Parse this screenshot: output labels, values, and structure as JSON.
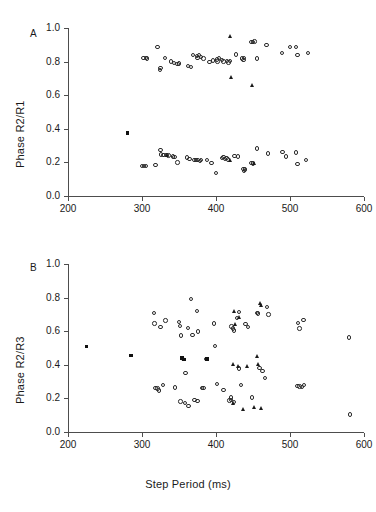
{
  "figure": {
    "xlabel": "Step Period (ms)",
    "background": "#ffffff",
    "marker_color": "#1a1a1a"
  },
  "chart_data": [
    {
      "type": "scatter",
      "panel": "A",
      "panel_letter": "A",
      "title": "",
      "xlabel": "",
      "ylabel": "Phase R2/R1",
      "xlim": [
        200,
        600
      ],
      "ylim": [
        0.0,
        1.0
      ],
      "xticks": [
        200,
        300,
        400,
        500,
        600
      ],
      "xticklabels": [
        "200",
        "300",
        "400",
        "500",
        "600"
      ],
      "yticks": [
        0.0,
        0.2,
        0.4,
        0.6,
        0.8,
        1.0
      ],
      "yticklabels": [
        "0.0",
        "0.2",
        "0.4",
        "0.6",
        "0.8",
        "1.0"
      ],
      "grid": false,
      "legend": "none",
      "series": [
        {
          "name": "open-circle",
          "marker": "circle",
          "points": [
            [
              302,
              0.823
            ],
            [
              305,
              0.82
            ],
            [
              307,
              0.818
            ],
            [
              321,
              0.888
            ],
            [
              324,
              0.75
            ],
            [
              325,
              0.762
            ],
            [
              331,
              0.82
            ],
            [
              339,
              0.8
            ],
            [
              343,
              0.79
            ],
            [
              348,
              0.785
            ],
            [
              350,
              0.788
            ],
            [
              362,
              0.775
            ],
            [
              366,
              0.767
            ],
            [
              369,
              0.838
            ],
            [
              374,
              0.832
            ],
            [
              375,
              0.82
            ],
            [
              377,
              0.838
            ],
            [
              380,
              0.826
            ],
            [
              383,
              0.818
            ],
            [
              391,
              0.797
            ],
            [
              396,
              0.806
            ],
            [
              401,
              0.812
            ],
            [
              402,
              0.8
            ],
            [
              404,
              0.82
            ],
            [
              408,
              0.808
            ],
            [
              410,
              0.8
            ],
            [
              415,
              0.805
            ],
            [
              417,
              0.795
            ],
            [
              419,
              0.802
            ],
            [
              427,
              0.842
            ],
            [
              435,
              0.818
            ],
            [
              437,
              0.808
            ],
            [
              438,
              0.82
            ],
            [
              448,
              0.918
            ],
            [
              450,
              0.915
            ],
            [
              452,
              0.92
            ],
            [
              455,
              0.818
            ],
            [
              468,
              0.9
            ],
            [
              489,
              0.852
            ],
            [
              500,
              0.888
            ],
            [
              508,
              0.886
            ],
            [
              510,
              0.838
            ],
            [
              524,
              0.852
            ],
            [
              300,
              0.18
            ],
            [
              303,
              0.178
            ],
            [
              305,
              0.18
            ],
            [
              318,
              0.185
            ],
            [
              325,
              0.272
            ],
            [
              326,
              0.248
            ],
            [
              329,
              0.243
            ],
            [
              333,
              0.243
            ],
            [
              336,
              0.24
            ],
            [
              342,
              0.235
            ],
            [
              344,
              0.232
            ],
            [
              348,
              0.2
            ],
            [
              361,
              0.228
            ],
            [
              364,
              0.222
            ],
            [
              371,
              0.213
            ],
            [
              373,
              0.214
            ],
            [
              375,
              0.215
            ],
            [
              378,
              0.21
            ],
            [
              380,
              0.214
            ],
            [
              388,
              0.214
            ],
            [
              394,
              0.198
            ],
            [
              400,
              0.138
            ],
            [
              408,
              0.226
            ],
            [
              410,
              0.232
            ],
            [
              412,
              0.219
            ],
            [
              414,
              0.225
            ],
            [
              416,
              0.218
            ],
            [
              425,
              0.238
            ],
            [
              430,
              0.235
            ],
            [
              437,
              0.16
            ],
            [
              438,
              0.15
            ],
            [
              439,
              0.158
            ],
            [
              448,
              0.196
            ],
            [
              450,
              0.193
            ],
            [
              455,
              0.282
            ],
            [
              470,
              0.252
            ],
            [
              490,
              0.262
            ],
            [
              495,
              0.236
            ],
            [
              508,
              0.258
            ],
            [
              510,
              0.192
            ],
            [
              522,
              0.215
            ]
          ]
        },
        {
          "name": "filled-triangle",
          "marker": "triangle",
          "points": [
            [
              420,
              0.948
            ],
            [
              421,
              0.706
            ],
            [
              450,
              0.66
            ],
            [
              334,
              0.243
            ],
            [
              420,
              0.21
            ],
            [
              452,
              0.193
            ]
          ]
        },
        {
          "name": "filled-square",
          "marker": "square",
          "points": [
            [
              280,
              0.375
            ]
          ]
        }
      ]
    },
    {
      "type": "scatter",
      "panel": "B",
      "panel_letter": "B",
      "title": "",
      "xlabel": "Step Period (ms)",
      "ylabel": "Phase R2/R3",
      "xlim": [
        200,
        600
      ],
      "ylim": [
        0.0,
        1.0
      ],
      "xticks": [
        200,
        300,
        400,
        500,
        600
      ],
      "xticklabels": [
        "200",
        "300",
        "400",
        "500",
        "600"
      ],
      "yticks": [
        0.0,
        0.2,
        0.4,
        0.6,
        0.8,
        1.0
      ],
      "yticklabels": [
        "0.0",
        "0.2",
        "0.4",
        "0.6",
        "0.8",
        "1.0"
      ],
      "grid": false,
      "legend": "none",
      "series": [
        {
          "name": "open-circle",
          "marker": "circle",
          "points": [
            [
              316,
              0.71
            ],
            [
              317,
              0.645
            ],
            [
              325,
              0.625
            ],
            [
              332,
              0.663
            ],
            [
              350,
              0.655
            ],
            [
              351,
              0.63
            ],
            [
              353,
              0.575
            ],
            [
              355,
              0.435
            ],
            [
              359,
              0.352
            ],
            [
              362,
              0.62
            ],
            [
              366,
              0.79
            ],
            [
              368,
              0.578
            ],
            [
              374,
              0.722
            ],
            [
              376,
              0.598
            ],
            [
              381,
              0.262
            ],
            [
              383,
              0.262
            ],
            [
              397,
              0.645
            ],
            [
              399,
              0.512
            ],
            [
              401,
              0.285
            ],
            [
              410,
              0.25
            ],
            [
              418,
              0.188
            ],
            [
              420,
              0.205
            ],
            [
              421,
              0.628
            ],
            [
              423,
              0.615
            ],
            [
              424,
              0.605
            ],
            [
              428,
              0.678
            ],
            [
              431,
              0.715
            ],
            [
              434,
              0.28
            ],
            [
              440,
              0.642
            ],
            [
              443,
              0.625
            ],
            [
              449,
              0.205
            ],
            [
              455,
              0.71
            ],
            [
              457,
              0.705
            ],
            [
              459,
              0.382
            ],
            [
              463,
              0.362
            ],
            [
              466,
              0.322
            ],
            [
              469,
              0.745
            ],
            [
              471,
              0.7
            ],
            [
              511,
              0.65
            ],
            [
              513,
              0.615
            ],
            [
              518,
              0.668
            ],
            [
              510,
              0.272
            ],
            [
              513,
              0.27
            ],
            [
              516,
              0.268
            ],
            [
              519,
              0.278
            ],
            [
              580,
              0.562
            ],
            [
              581,
              0.105
            ],
            [
              318,
              0.262
            ],
            [
              321,
              0.258
            ],
            [
              323,
              0.248
            ],
            [
              328,
              0.278
            ],
            [
              345,
              0.265
            ],
            [
              352,
              0.182
            ],
            [
              358,
              0.172
            ],
            [
              363,
              0.155
            ],
            [
              371,
              0.192
            ],
            [
              375,
              0.185
            ],
            [
              387,
              0.435
            ],
            [
              420,
              0.192
            ],
            [
              424,
              0.178
            ],
            [
              431,
              0.378
            ]
          ]
        },
        {
          "name": "filled-triangle",
          "marker": "triangle",
          "points": [
            [
              425,
              0.718
            ],
            [
              427,
              0.64
            ],
            [
              432,
              0.68
            ],
            [
              460,
              0.762
            ],
            [
              461,
              0.75
            ],
            [
              424,
              0.4
            ],
            [
              430,
              0.392
            ],
            [
              443,
              0.392
            ],
            [
              456,
              0.45
            ],
            [
              458,
              0.4
            ],
            [
              437,
              0.135
            ],
            [
              452,
              0.148
            ],
            [
              462,
              0.138
            ],
            [
              424,
              0.172
            ]
          ]
        },
        {
          "name": "filled-square",
          "marker": "square",
          "points": [
            [
              225,
              0.51
            ],
            [
              285,
              0.455
            ],
            [
              354,
              0.44
            ],
            [
              357,
              0.432
            ],
            [
              388,
              0.435
            ]
          ]
        }
      ]
    }
  ]
}
